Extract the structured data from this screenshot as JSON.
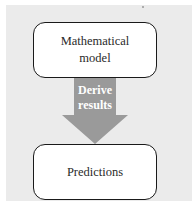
{
  "diagram": {
    "top_box": {
      "label": "Mathematical model",
      "line1": "Mathematical",
      "line2": "model"
    },
    "arrow": {
      "label": "Derive results",
      "line1": "Derive",
      "line2": "results",
      "color": "#999999"
    },
    "bottom_box": {
      "label": "Predictions"
    },
    "background_color": "#ebebeb"
  }
}
